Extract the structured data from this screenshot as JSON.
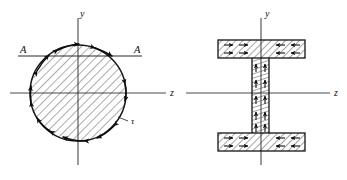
{
  "figure": {
    "caption_absent": true,
    "background_color": "#ffffff",
    "ink_color": "#111111",
    "panels": [
      {
        "id": "circular-section",
        "name": "circular-cross-section",
        "shape": "circle",
        "center": {
          "x": 78,
          "y": 93
        },
        "radius": 48,
        "hatch_angle_deg": 45,
        "axes": {
          "vertical": {
            "label": "y",
            "label_x": 80,
            "label_y": 17,
            "x": 78,
            "y_start": 18,
            "y_end": 165
          },
          "horizontal": {
            "label": "z",
            "label_x": 170,
            "label_y": 96,
            "y": 93,
            "x_start": 10,
            "x_end": 166
          }
        },
        "section_cut": {
          "label_left": "A",
          "label_right": "A",
          "label_left_x": 20,
          "label_left_y": 53,
          "label_right_x": 134,
          "label_right_y": 53,
          "line_y": 56,
          "line_x_start": 18,
          "line_x_end": 142
        },
        "stress_label": {
          "symbol": "τ",
          "x": 131,
          "y": 123
        },
        "stress_arrow_count": 8,
        "stress_arrow_angles_deg": [
          20,
          60,
          105,
          150,
          200,
          245,
          290,
          335
        ],
        "stress_arrow_type": "tangential-double-headed"
      },
      {
        "id": "ibeam-section",
        "name": "wide-flange-cross-section",
        "shape": "i-beam",
        "center": {
          "x": 261,
          "y": 93
        },
        "flange_left": 218,
        "flange_right": 305,
        "top_flange_top": 40,
        "top_flange_bottom": 58,
        "bottom_flange_top": 133,
        "bottom_flange_bottom": 151,
        "web_left": 252,
        "web_right": 269,
        "hatch_angle_flange_deg": 45,
        "hatch_angle_web_deg": 90,
        "axes": {
          "vertical": {
            "label": "y",
            "label_x": 265,
            "label_y": 17,
            "x": 261,
            "y_start": 18,
            "y_end": 165
          },
          "horizontal": {
            "label": "z",
            "label_x": 334,
            "label_y": 96,
            "y": 93,
            "x_start": 186,
            "x_end": 330
          }
        },
        "shear_flow_marks": {
          "flange_direction": "horizontal",
          "web_direction": "vertical"
        }
      }
    ]
  }
}
